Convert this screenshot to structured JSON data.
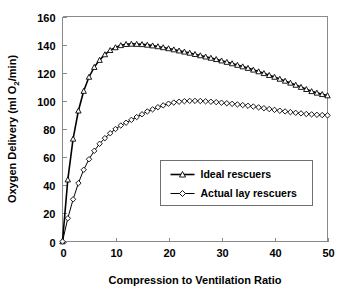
{
  "chart_data": {
    "type": "line",
    "title": "",
    "xlabel": "Compression to Ventilation Ratio",
    "ylabel": "Oxygen Delivery (ml O2/min)",
    "ylabel_parts": {
      "pre": "Oxygen Delivery (ml O",
      "sub": "2",
      "post": "/min)"
    },
    "xlim": [
      0,
      50
    ],
    "ylim": [
      0,
      160
    ],
    "xticks": [
      0,
      10,
      20,
      30,
      40,
      50
    ],
    "yticks": [
      0,
      20,
      40,
      60,
      80,
      100,
      120,
      140,
      160
    ],
    "xtick_labels": [
      "0",
      "10",
      "20",
      "30",
      "40",
      "50"
    ],
    "ytick_labels": [
      "0",
      "20",
      "40",
      "60",
      "80",
      "100",
      "120",
      "140",
      "160"
    ],
    "grid": false,
    "legend_position": "center-right-lower",
    "series": [
      {
        "name": "Ideal rescuers",
        "marker": "triangle",
        "x": [
          0,
          1,
          2,
          3,
          4,
          5,
          6,
          7,
          8,
          9,
          10,
          11,
          12,
          13,
          14,
          15,
          16,
          17,
          18,
          19,
          20,
          21,
          22,
          23,
          24,
          25,
          26,
          27,
          28,
          29,
          30,
          31,
          32,
          33,
          34,
          35,
          36,
          37,
          38,
          39,
          40,
          41,
          42,
          43,
          44,
          45,
          46,
          47,
          48,
          49,
          50
        ],
        "values": [
          0,
          44,
          73,
          93,
          107,
          117,
          124,
          129,
          133,
          136,
          138,
          139.5,
          140.3,
          140.5,
          140.4,
          140.2,
          139.8,
          139.3,
          138.7,
          138.0,
          137.3,
          136.5,
          135.7,
          134.9,
          134.1,
          133.2,
          132.3,
          131.4,
          130.5,
          129.6,
          128.6,
          127.6,
          126.6,
          125.5,
          124.4,
          123.3,
          122.1,
          120.9,
          119.6,
          118.3,
          117.0,
          115.6,
          114.2,
          112.8,
          111.3,
          109.8,
          108.3,
          106.8,
          105.7,
          104.7,
          103.8
        ]
      },
      {
        "name": "Actual lay rescuers",
        "marker": "diamond",
        "x": [
          0,
          1,
          2,
          3,
          4,
          5,
          6,
          7,
          8,
          9,
          10,
          11,
          12,
          13,
          14,
          15,
          16,
          17,
          18,
          19,
          20,
          21,
          22,
          23,
          24,
          25,
          26,
          27,
          28,
          29,
          30,
          31,
          32,
          33,
          34,
          35,
          36,
          37,
          38,
          39,
          40,
          41,
          42,
          43,
          44,
          45,
          46,
          47,
          48,
          49,
          50
        ],
        "values": [
          0,
          16.5,
          30,
          41.5,
          51,
          58.5,
          64.5,
          69.5,
          73.5,
          77,
          80,
          82.5,
          84.5,
          86.5,
          88.5,
          90.5,
          92.5,
          94,
          95.5,
          96.8,
          98,
          98.8,
          99.4,
          99.8,
          100,
          100,
          99.9,
          99.7,
          99.4,
          99.1,
          98.7,
          98.3,
          97.9,
          97.5,
          97.0,
          96.5,
          96.0,
          95.4,
          94.8,
          94.2,
          93.6,
          93.0,
          92.5,
          92.0,
          91.5,
          91.1,
          90.7,
          90.4,
          90.1,
          89.9,
          89.7
        ]
      }
    ]
  },
  "legend": {
    "entries": [
      {
        "label": "Ideal rescuers",
        "marker": "triangle"
      },
      {
        "label": "Actual lay rescuers",
        "marker": "diamond"
      }
    ]
  }
}
